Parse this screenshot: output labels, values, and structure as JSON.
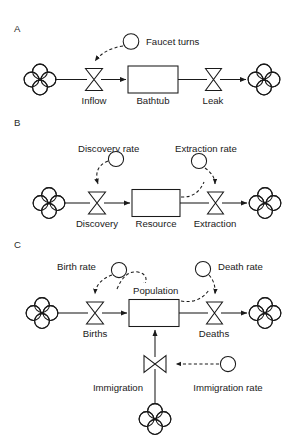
{
  "figure": {
    "kind": "system-dynamics-stock-and-flow-diagram",
    "panels": [
      {
        "id": "A",
        "label": "A",
        "stock": "Bathtub",
        "inflow_valve": "Inflow",
        "outflow_valve": "Leak",
        "converters": [
          "Faucet turns"
        ],
        "source_cloud": "cloud",
        "sink_cloud": "cloud",
        "influence_links": [
          {
            "from": "Faucet turns",
            "to": "Inflow",
            "style": "dashed"
          }
        ]
      },
      {
        "id": "B",
        "label": "B",
        "stock": "Resource",
        "inflow_valve": "Discovery",
        "outflow_valve": "Extraction",
        "converters": [
          "Discovery rate",
          "Extraction rate"
        ],
        "source_cloud": "cloud",
        "sink_cloud": "cloud",
        "influence_links": [
          {
            "from": "Discovery rate",
            "to": "Discovery",
            "style": "dashed"
          },
          {
            "from": "Extraction rate",
            "to": "Extraction",
            "style": "dashed"
          },
          {
            "from": "Resource",
            "to": "Extraction",
            "style": "dashed"
          }
        ]
      },
      {
        "id": "C",
        "label": "C",
        "stock": "Population",
        "inflow_valve": "Births",
        "outflow_valve": "Deaths",
        "vertical_inflow_valve": "Immigration",
        "converters": [
          "Birth rate",
          "Death rate",
          "Immigration rate"
        ],
        "source_cloud": "cloud",
        "sink_cloud": "cloud",
        "bottom_cloud": "cloud",
        "influence_links": [
          {
            "from": "Birth rate",
            "to": "Births",
            "style": "dashed"
          },
          {
            "from": "Population",
            "to": "Birth rate",
            "style": "dashed"
          },
          {
            "from": "Death rate",
            "to": "Deaths",
            "style": "dashed"
          },
          {
            "from": "Population",
            "to": "Deaths",
            "style": "dashed"
          },
          {
            "from": "Immigration rate",
            "to": "Immigration",
            "style": "dashed"
          }
        ]
      }
    ],
    "labels": {
      "panel_a": "A",
      "panel_b": "B",
      "panel_c": "C",
      "faucet_turns": "Faucet turns",
      "inflow": "Inflow",
      "bathtub": "Bathtub",
      "leak": "Leak",
      "discovery_rate": "Discovery rate",
      "extraction_rate": "Extraction rate",
      "discovery": "Discovery",
      "resource": "Resource",
      "extraction": "Extraction",
      "birth_rate": "Birth rate",
      "death_rate": "Death rate",
      "population": "Population",
      "births": "Births",
      "deaths": "Deaths",
      "immigration": "Immigration",
      "immigration_rate": "Immigration rate"
    },
    "colors": {
      "background": "#ffffff",
      "stroke": "#1a1a1a",
      "text": "#1a1a1a",
      "shape_fill": "#ffffff"
    }
  }
}
